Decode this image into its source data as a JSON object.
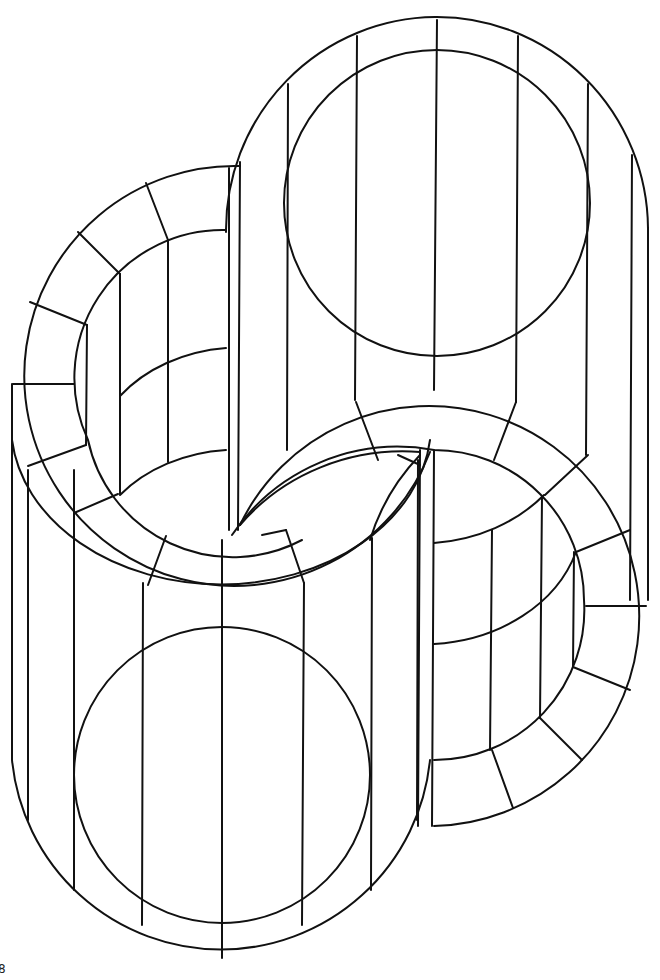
{
  "page": {
    "page_number": "8",
    "artwork": {
      "subject": "impossible-figure-two-interlocking-cylinders-line-art",
      "line_color": "#111111",
      "background": "#ffffff"
    }
  }
}
